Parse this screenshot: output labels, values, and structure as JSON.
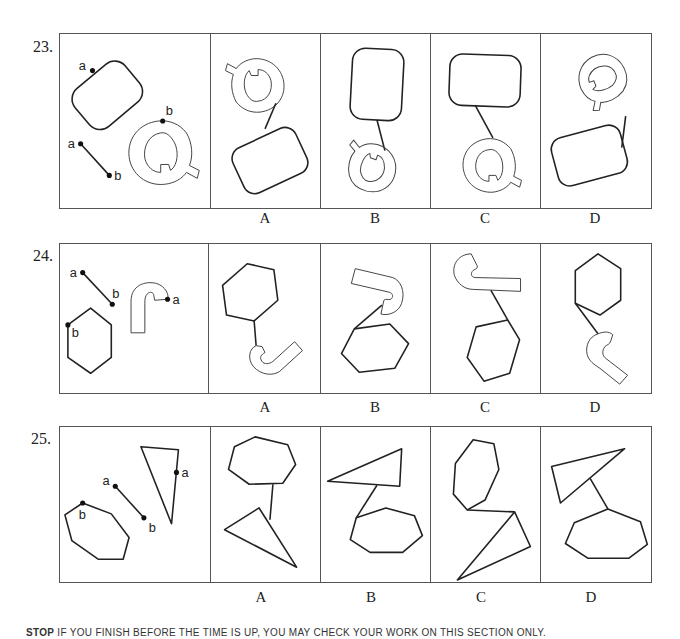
{
  "questions": [
    {
      "number": "23.",
      "prompt_labels": {
        "point_a_shape": "a",
        "point_b_shape": "b",
        "line_a": "a",
        "line_b": "b"
      },
      "pieces": [
        "rounded-rectangle",
        "letter-Q",
        "connector-line"
      ],
      "choices": [
        "A",
        "B",
        "C",
        "D"
      ]
    },
    {
      "number": "24.",
      "prompt_labels": {
        "line_a": "a",
        "line_b": "b",
        "hexagon_b": "b",
        "hook_a": "a"
      },
      "pieces": [
        "hexagon",
        "hook-shape",
        "connector-line"
      ],
      "choices": [
        "A",
        "B",
        "C",
        "D"
      ]
    },
    {
      "number": "25.",
      "prompt_labels": {
        "line_a": "a",
        "line_b": "b",
        "octagon_b": "b",
        "triangle_a": "a"
      },
      "pieces": [
        "octagon",
        "triangle",
        "connector-line"
      ],
      "choices": [
        "A",
        "B",
        "C",
        "D"
      ]
    }
  ],
  "footer": {
    "stop_label": "STOP",
    "text": "IF YOU FINISH BEFORE THE TIME IS UP, YOU MAY CHECK YOUR WORK ON THIS SECTION ONLY."
  }
}
